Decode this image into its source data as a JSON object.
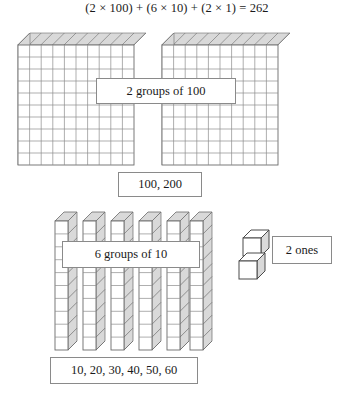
{
  "equation": {
    "text": "(2 × 100) + (6 × 10) + (2 × 1) = 262",
    "terms": [
      {
        "factor_a": 2,
        "factor_b": 100,
        "product": 200
      },
      {
        "factor_a": 6,
        "factor_b": 10,
        "product": 60
      },
      {
        "factor_a": 2,
        "factor_b": 1,
        "product": 2
      }
    ],
    "total": 262
  },
  "labels": {
    "hundreds_group": "2 groups of 100",
    "hundreds_skip_count": "100, 200",
    "tens_group": "6 groups of 10",
    "tens_skip_count": "10, 20, 30, 40, 50, 60",
    "ones_group": "2 ones"
  },
  "blocks": {
    "hundreds": {
      "count": 2,
      "unit_value": 100,
      "grid_rows": 10,
      "grid_cols": 10
    },
    "tens": {
      "count": 6,
      "unit_value": 10,
      "segments_per_rod": 10
    },
    "ones": {
      "count": 2,
      "unit_value": 1
    }
  },
  "colors": {
    "background": "#ffffff",
    "text": "#1a1a1a",
    "block_line": "#6b6b6b",
    "block_face": "#ffffff",
    "block_shade": "#d4d4d4",
    "box_border": "#8a8a8a"
  }
}
